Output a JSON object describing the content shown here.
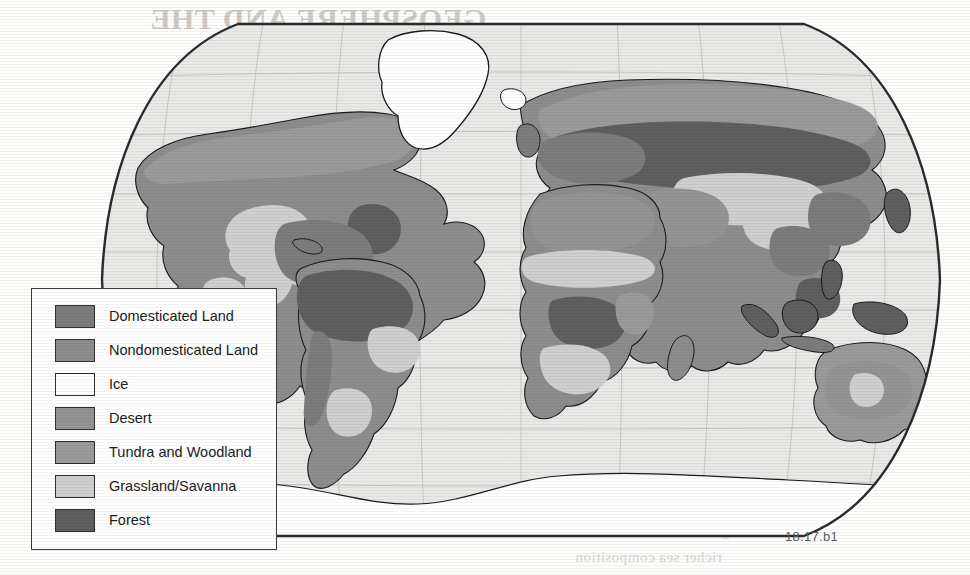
{
  "figure": {
    "id_label": "18.17.b1",
    "projection": "robinson",
    "ocean_color": "#e9e9e7",
    "graticule_color": "#b6b6b4",
    "frame_color": "#2b2b2b",
    "coast_color": "#1a1a1a"
  },
  "legend": {
    "items": [
      {
        "label": "Domesticated Land",
        "color": "#7c7c7c"
      },
      {
        "label": "Nondomesticated Land",
        "color": "#8d8d8d"
      },
      {
        "label": "Ice",
        "color": "#ffffff"
      },
      {
        "label": "Desert",
        "color": "#949494"
      },
      {
        "label": "Tundra and Woodland",
        "color": "#9a9a9a"
      },
      {
        "label": "Grassland/Savanna",
        "color": "#cfcfcf"
      },
      {
        "label": "Forest",
        "color": "#5f5f5f"
      }
    ]
  },
  "bleed_through": {
    "top_title": "GEOSPHERE AND THE",
    "top_line_1": "variation in the",
    "top_line_2": "characteristics",
    "left_line_1": "regional",
    "left_line_2": "climate",
    "bottom_line_1": "equation over time",
    "bottom_line_2": "growth with new",
    "bottom_line_3": "richer sea composition"
  }
}
